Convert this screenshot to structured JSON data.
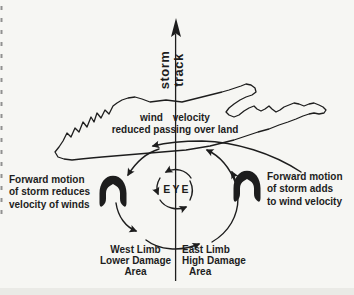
{
  "figure": {
    "type": "hurricane-circulation-diagram",
    "background_color": "#f6f6f3",
    "ink_color": "#1d1d1d"
  },
  "labels": {
    "storm_track": {
      "line1": "storm",
      "line2": "track"
    },
    "wind_velocity": {
      "line1": "wind velocity",
      "line2": "reduced passing over land"
    },
    "eye": "EYE",
    "forward_motion_left": {
      "line1": "Forward motion",
      "line2": "of storm reduces",
      "line3": "velocity of winds"
    },
    "forward_motion_right": {
      "line1": "Forward motion",
      "line2": "of storm adds",
      "line3": "to wind velocity"
    },
    "west_limb": {
      "line1": "West Limb",
      "line2": "Lower Damage",
      "line3": "Area"
    },
    "east_limb": {
      "line1": "East Limb",
      "line2": "High Damage",
      "line3": "Area"
    }
  }
}
